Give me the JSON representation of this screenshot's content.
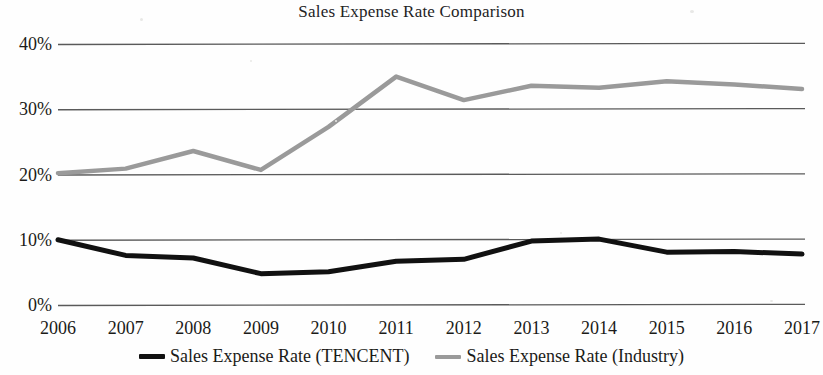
{
  "chart_data": {
    "type": "line",
    "title": "Sales Expense Rate Comparison",
    "xlabel": "",
    "ylabel": "",
    "x": [
      "2006",
      "2007",
      "2008",
      "2009",
      "2010",
      "2011",
      "2012",
      "2013",
      "2014",
      "2015",
      "2016",
      "2017"
    ],
    "categories": [
      "2006",
      "2007",
      "2008",
      "2009",
      "2010",
      "2011",
      "2012",
      "2013",
      "2014",
      "2015",
      "2016",
      "2017"
    ],
    "series": [
      {
        "name": "Sales Expense Rate (TENCENT)",
        "color": "#111111",
        "values": [
          10.0,
          7.6,
          7.2,
          4.8,
          5.1,
          6.7,
          7.0,
          9.8,
          10.1,
          8.1,
          8.2,
          7.8
        ]
      },
      {
        "name": "Sales Expense Rate (Industry)",
        "color": "#9a9a9a",
        "values": [
          20.2,
          20.9,
          23.6,
          20.7,
          27.3,
          35.0,
          31.4,
          33.6,
          33.3,
          34.3,
          33.8,
          33.1
        ]
      }
    ],
    "ylim": [
      0,
      40
    ],
    "yticks": [
      0,
      10,
      20,
      30,
      40
    ],
    "ytick_labels": [
      "0%",
      "10%",
      "20%",
      "30%",
      "40%"
    ],
    "grid": true,
    "grid_axis": "y",
    "grid_color": "#5a5a5a",
    "legend_position": "bottom",
    "legend": [
      "Sales Expense Rate (TENCENT)",
      "Sales Expense Rate (Industry)"
    ]
  },
  "legend": {
    "entries": [
      {
        "label": "Sales Expense Rate (TENCENT)",
        "color": "#111111"
      },
      {
        "label": "Sales Expense Rate (Industry)",
        "color": "#9a9a9a"
      }
    ]
  }
}
